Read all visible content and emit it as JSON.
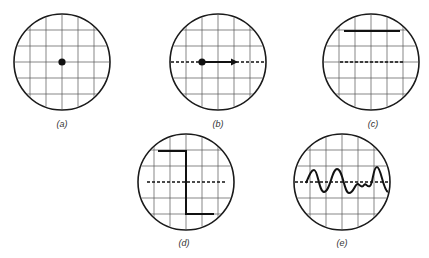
{
  "figure": {
    "panels": [
      {
        "id": "a",
        "label": "(a)",
        "cx": 62,
        "cy": 62,
        "r": 48,
        "content": "centered dot"
      },
      {
        "id": "b",
        "label": "(b)",
        "cx": 218,
        "cy": 62,
        "r": 48,
        "content": "dot with horizontal arrow on dashed baseline"
      },
      {
        "id": "c",
        "label": "(c)",
        "cx": 371,
        "cy": 62,
        "r": 48,
        "content": "solid line near top above dashed baseline"
      },
      {
        "id": "d",
        "label": "(d)",
        "cx": 186,
        "cy": 182,
        "r": 48,
        "content": "step waveform crossing dashed baseline"
      },
      {
        "id": "e",
        "label": "(e)",
        "cx": 342,
        "cy": 182,
        "r": 48,
        "content": "damped oscillating waveform on dashed baseline"
      }
    ],
    "grid_spacing": 16,
    "colors": {
      "trace": "#111111",
      "grid": "#555555",
      "rim": "#1a1a1a",
      "background": "#ffffff"
    }
  }
}
